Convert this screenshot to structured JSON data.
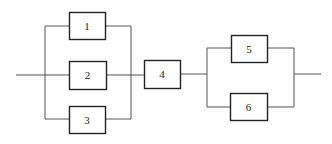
{
  "diagram": {
    "type": "reliability-block-diagram",
    "colors": {
      "line": "#555555",
      "box_stroke": "#222222",
      "background": "#ffffff"
    },
    "blocks": [
      {
        "id": "1",
        "label": "1",
        "x": 69,
        "y": 12,
        "w": 36,
        "h": 27
      },
      {
        "id": "2",
        "label": "2",
        "x": 69,
        "y": 61,
        "w": 37,
        "h": 28
      },
      {
        "id": "3",
        "label": "3",
        "x": 69,
        "y": 106,
        "w": 36,
        "h": 27
      },
      {
        "id": "4",
        "label": "4",
        "x": 144,
        "y": 60,
        "w": 36,
        "h": 28
      },
      {
        "id": "5",
        "label": "5",
        "x": 231,
        "y": 35,
        "w": 36,
        "h": 27
      },
      {
        "id": "6",
        "label": "6",
        "x": 230,
        "y": 93,
        "w": 37,
        "h": 27
      }
    ],
    "structure": "(1 || 2 || 3) -> 4 -> (5 || 6)"
  }
}
